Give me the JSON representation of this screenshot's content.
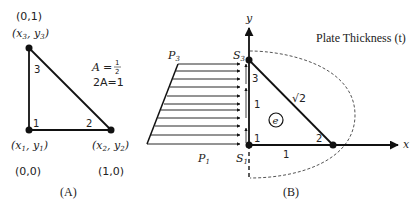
{
  "panel_a": {
    "caption": "(A)",
    "area_label_lhs": "A",
    "area_label_eq": "=",
    "area_numerator": "1",
    "area_denominator": "2",
    "two_area_label": "2A=1",
    "nodes": [
      {
        "id": "1",
        "number_label": "1",
        "symbol": "x",
        "sym2": "y",
        "sub": "1",
        "coords": "(0,0)"
      },
      {
        "id": "2",
        "number_label": "2",
        "symbol": "x",
        "sym2": "y",
        "sub": "2",
        "coords": "(1,0)"
      },
      {
        "id": "3",
        "number_label": "3",
        "symbol": "x",
        "sym2": "y",
        "sub": "3",
        "coords": "(0,1)"
      }
    ]
  },
  "panel_b": {
    "caption": "(B)",
    "title": "Plate Thickness (t)",
    "axis_x": "x",
    "axis_y": "y",
    "element_label": "e",
    "hypotenuse_length": "√2",
    "side_bottom_length": "1",
    "corner_labels": {
      "n1": "1",
      "n2": "2",
      "n3": "3"
    },
    "edge_segment_labels": [
      "1",
      "1"
    ],
    "surface_labels": {
      "s1": "S",
      "s1_sub": "1",
      "s3": "S",
      "s3_sub": "3"
    },
    "load_labels": {
      "p1": "P",
      "p1_sub": "1",
      "p3": "P",
      "p3_sub": "3"
    }
  },
  "colors": {
    "stroke": "#111111",
    "text": "#222222",
    "dashed": "#555555"
  }
}
